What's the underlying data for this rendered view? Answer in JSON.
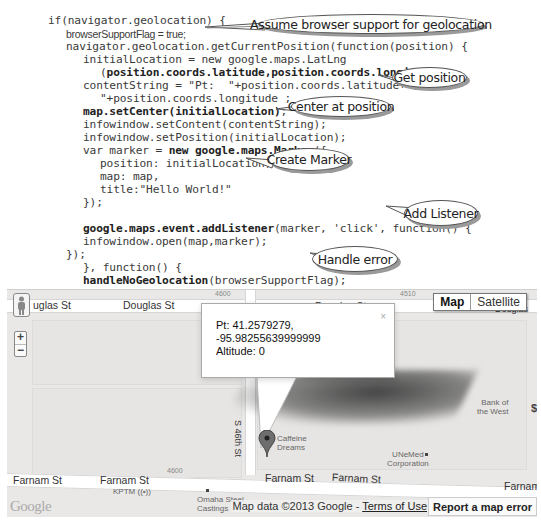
{
  "code": {
    "lines": [
      {
        "text": "if(navigator.geolocation) {",
        "bold": ""
      },
      {
        "text": "browserSupportFlag = true;",
        "bold": ""
      },
      {
        "text": "navigator.geolocation.getCurrentPosition(function(position) {",
        "bold": ""
      },
      {
        "text": "initialLocation = new google.maps.LatLng",
        "bold": ""
      },
      {
        "text": "(position.coords.latitude,position.coords.longitude);",
        "bold": "position.coords.latitude,position.coords.longitude"
      },
      {
        "text": "contentString = \"Pt:  \"+position.coords.latitude+\",",
        "bold": ""
      },
      {
        "text": "\"+position.coords.longitude ;",
        "bold": ""
      },
      {
        "text": "map.setCenter(initialLocation);",
        "bold": "map.setCenter(initialLocation)"
      },
      {
        "text": "infowindow.setContent(contentString);",
        "bold": ""
      },
      {
        "text": "infowindow.setPosition(initialLocation);",
        "bold": ""
      },
      {
        "text": "var marker = new google.maps.Marker({",
        "bold": "new google.maps.Marker"
      },
      {
        "text": "position: initialLocation,",
        "bold": ""
      },
      {
        "text": "map: map,",
        "bold": ""
      },
      {
        "text": "title:\"Hello World!\"",
        "bold": ""
      },
      {
        "text": "});",
        "bold": ""
      },
      {
        "text": "",
        "bold": ""
      },
      {
        "text": "google.maps.event.addListener(marker, 'click', function() {",
        "bold": "google.maps.event.addListener"
      },
      {
        "text": "infowindow.open(map,marker);",
        "bold": ""
      },
      {
        "text": "});",
        "bold": ""
      },
      {
        "text": "}, function() {",
        "bold": ""
      },
      {
        "text": "handleNoGeolocation(browserSupportFlag);",
        "bold": "handleNoGeolocation"
      },
      {
        "text": "});",
        "bold": ""
      },
      {
        "text": "}",
        "bold": ""
      },
      {
        "text": "}",
        "bold": ""
      }
    ]
  },
  "callouts": {
    "assume": "Assume browser support for geolocation",
    "get_position": "Get position",
    "center": "Center at position",
    "create_marker": "Create Marker",
    "add_listener": "Add Listener",
    "handle_error": "Handle error"
  },
  "map": {
    "streets": {
      "douglas_left": "uglas St",
      "douglas_mid": "Douglas St",
      "douglas_right": "Douglas St",
      "douglas_edge": "Douglas",
      "farnam_1": "Farnam St",
      "farnam_2": "Farnam St",
      "farnam_3": "Farnam St",
      "farnam_4": "Farnam St",
      "farnam_edge": "Farnam",
      "s46th": "S 46th St"
    },
    "block_numbers": {
      "n4600_top": "4600",
      "n4510": "4510",
      "n4600_bottom": "4600"
    },
    "pois": {
      "caffeine": "Caffeine\nDreams",
      "bank": "Bank of\nthe West",
      "unemed": "UNeMed\nCorporation",
      "kptm": "KPTM",
      "omaha_steel": "Omaha Steel\nCastings"
    },
    "controls": {
      "zoom_in": "+",
      "zoom_out": "−",
      "map_type_map": "Map",
      "map_type_satellite": "Satellite"
    },
    "infowindow": {
      "line1": "Pt: 41.2579279, -95.98255639999999",
      "line2": "Altitude: 0",
      "close": "×"
    },
    "footer": {
      "logo": "Google",
      "map_data": "Map data ©2013 Google - ",
      "terms": "Terms of Use",
      "report": "Report a map error"
    },
    "colors": {
      "marker": "#555555",
      "road": "#ffffff",
      "land": "#e9e8e6"
    }
  }
}
